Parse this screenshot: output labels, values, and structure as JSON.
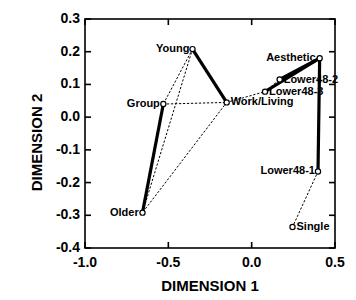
{
  "chart_data": {
    "type": "scatter",
    "title": "",
    "xlabel": "DIMENSION 1",
    "ylabel": "DIMENSION 2",
    "xlim": [
      -1.0,
      0.5
    ],
    "ylim": [
      -0.4,
      0.3
    ],
    "xticks": [
      "-1.0",
      "-0.5",
      "0.0",
      "0.5"
    ],
    "xtick_values": [
      -1.0,
      -0.5,
      0.0,
      0.5
    ],
    "yticks": [
      "0.3",
      "0.2",
      "0.1",
      "0.0",
      "-0.1",
      "-0.2",
      "-0.3",
      "-0.4"
    ],
    "ytick_values": [
      0.3,
      0.2,
      0.1,
      0.0,
      -0.1,
      -0.2,
      -0.3,
      -0.4
    ],
    "grid": false,
    "legend": "none",
    "marker": "open-circle",
    "points": [
      {
        "label": "Young",
        "x": -0.355,
        "y": 0.208,
        "label_side": "left"
      },
      {
        "label": "Group",
        "x": -0.53,
        "y": 0.04,
        "label_side": "left"
      },
      {
        "label": "Older",
        "x": -0.655,
        "y": -0.292,
        "label_side": "left"
      },
      {
        "label": "Work/Living",
        "x": -0.15,
        "y": 0.045,
        "label_side": "right"
      },
      {
        "label": "Aesthetic",
        "x": 0.408,
        "y": 0.18,
        "label_side": "left"
      },
      {
        "label": "Lower48-2",
        "x": 0.168,
        "y": 0.115,
        "label_side": "right"
      },
      {
        "label": "Lower48-3",
        "x": 0.08,
        "y": 0.078,
        "label_side": "right"
      },
      {
        "label": "Lower48-1",
        "x": 0.398,
        "y": -0.166,
        "label_side": "left"
      },
      {
        "label": "Single",
        "x": 0.245,
        "y": -0.336,
        "label_side": "right"
      }
    ],
    "solid_edges": [
      {
        "from": "Young",
        "to": "Work/Living"
      },
      {
        "from": "Group",
        "to": "Older"
      },
      {
        "from": "Lower48-3",
        "to": "Aesthetic"
      },
      {
        "from": "Lower48-2",
        "to": "Aesthetic"
      },
      {
        "from": "Aesthetic",
        "to": "Lower48-1"
      }
    ],
    "dotted_edges": [
      {
        "from": "Young",
        "to": "Group"
      },
      {
        "from": "Group",
        "to": "Work/Living"
      },
      {
        "from": "Young",
        "to": "Older"
      },
      {
        "from": "Work/Living",
        "to": "Older"
      },
      {
        "from": "Work/Living",
        "to": "Lower48-3"
      },
      {
        "from": "Lower48-3",
        "to": "Lower48-2"
      },
      {
        "from": "Lower48-1",
        "to": "Single"
      }
    ],
    "colors": {
      "axis": "#000000",
      "solid_line": "#000000",
      "dotted_line": "#000000",
      "marker": "#000000",
      "background": "#ffffff"
    },
    "line_styles": {
      "solid_width": 3.2,
      "dotted_width": 1.0,
      "dotted_dash": "1.5 2.5"
    }
  }
}
